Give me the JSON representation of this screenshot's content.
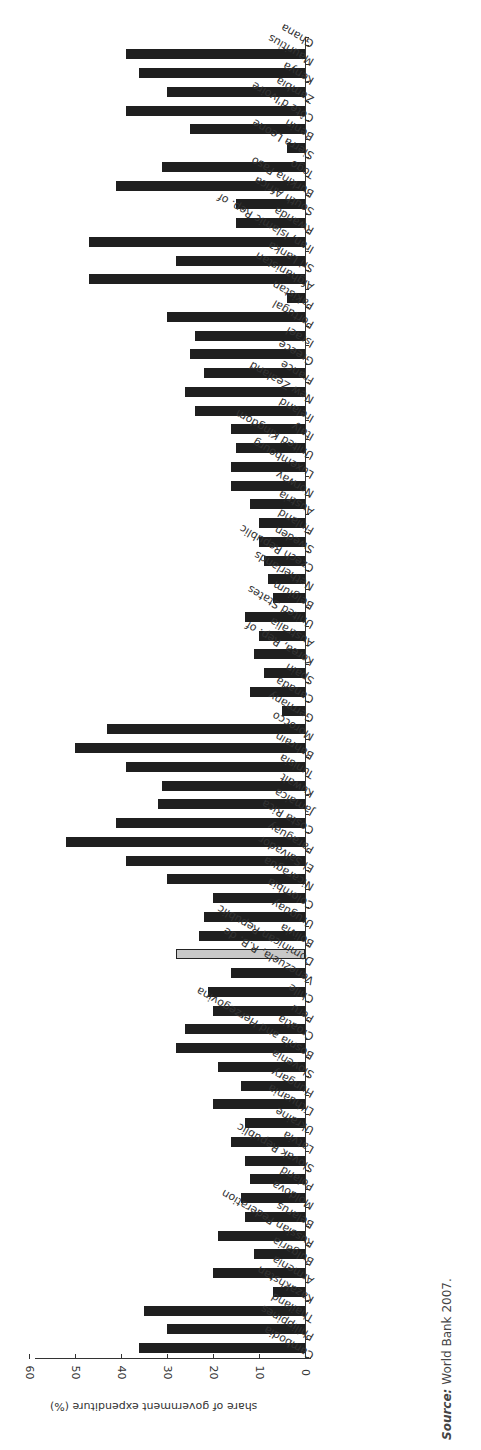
{
  "chart_data": {
    "type": "bar",
    "orientation": "rotated-90 (bars extend left from baseline; categories run top-to-bottom)",
    "ylabel": "share of government expenditure (%)",
    "xlabel": "",
    "ylim": [
      0,
      60
    ],
    "yticks": [
      0,
      10,
      20,
      30,
      40,
      50,
      60
    ],
    "grid": false,
    "legend": null,
    "highlight": {
      "category": "Dominican Republic",
      "color": "#c8c8c8"
    },
    "categories": [
      "Cambodia",
      "Philippines",
      "Thailand",
      "Kazakhstan",
      "Armenia",
      "Bulgaria",
      "Russian Federation",
      "Belarus",
      "Moldova",
      "Poland",
      "Slovak Republic",
      "Latvia",
      "Ukraine",
      "Lithuania",
      "Hungary",
      "Slovenia",
      "Bosnia and Herzegovina",
      "Croatia",
      "Peru",
      "Chile",
      "Venezuela, R.B. de",
      "Dominican Republic",
      "Bolivia",
      "Uruguay",
      "Colombia",
      "Nicaragua",
      "El Salvador",
      "Paraguay",
      "Costa Rica",
      "Jamaica",
      "Kuwait",
      "Tunisia",
      "Bahrain",
      "Morocco",
      "Germany",
      "Canada",
      "Spain",
      "Korea, Rep. of",
      "Australia",
      "United States",
      "Belgium",
      "Netherlands",
      "Czech Republic",
      "Sweden",
      "Finland",
      "Austria",
      "Norway",
      "Luxembourg",
      "United Kingdom",
      "Italy",
      "Ireland",
      "New Zealand",
      "France",
      "Greece",
      "Israel",
      "Portugal",
      "Pakistan",
      "Afghanistan",
      "Sri Lanka",
      "Iran, Islamic Rep. of",
      "Rwanda",
      "South Africa",
      "Burkina Faso",
      "Togo",
      "Sierra Leone",
      "Benin",
      "Côte d'Ivoire",
      "Zambia",
      "Kenya",
      "Mauritius",
      "Ghana"
    ],
    "values": [
      36,
      30,
      35,
      7,
      20,
      11,
      19,
      13,
      14,
      12,
      13,
      16,
      13,
      20,
      14,
      19,
      28,
      26,
      20,
      21,
      16,
      28,
      23,
      22,
      20,
      30,
      39,
      52,
      41,
      32,
      31,
      39,
      50,
      43,
      5,
      12,
      9,
      11,
      10,
      13,
      7,
      8,
      9,
      10,
      10,
      12,
      16,
      16,
      15,
      16,
      24,
      26,
      22,
      25,
      24,
      30,
      4,
      47,
      28,
      47,
      15,
      15,
      41,
      31,
      4,
      25,
      39,
      30,
      36,
      39,
      0
    ]
  },
  "source": {
    "prefix": "Source:",
    "text": " World Bank 2007."
  },
  "colors": {
    "bar": "#1f1f1f",
    "highlight": "#c8c8c8",
    "axis": "#333333"
  }
}
